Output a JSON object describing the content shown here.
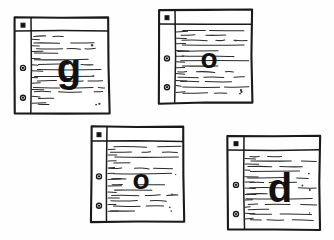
{
  "scene": {
    "title": "Hand-drawn notebook paper letter cards",
    "background_color": "#fefefe",
    "ink_color": "#1a1a1a",
    "word": "good",
    "card_count": 4
  },
  "cards": [
    {
      "id": "card-g",
      "letter": "g",
      "letter_name": "lowercase-g",
      "position": "top-left",
      "x": 15,
      "y": 18,
      "width": 94,
      "height": 96,
      "margin_x": 16,
      "header_y": 13,
      "letter_cx": 54,
      "letter_baseline": 64,
      "letter_size": 40,
      "holes": [
        "square",
        "ring",
        "ring"
      ]
    },
    {
      "id": "card-o-1",
      "letter": "o",
      "letter_name": "lowercase-o",
      "position": "top-right",
      "x": 159,
      "y": 10,
      "width": 93,
      "height": 93,
      "margin_x": 16,
      "header_y": 14,
      "letter_cx": 50,
      "letter_baseline": 58,
      "letter_size": 28,
      "holes": [
        "square",
        "ring",
        "ring"
      ]
    },
    {
      "id": "card-o-2",
      "letter": "o",
      "letter_name": "lowercase-o",
      "position": "bottom-left",
      "x": 91,
      "y": 127,
      "width": 93,
      "height": 95,
      "margin_x": 16,
      "header_y": 14,
      "letter_cx": 50,
      "letter_baseline": 62,
      "letter_size": 28,
      "holes": [
        "square",
        "ring",
        "ring"
      ]
    },
    {
      "id": "card-d",
      "letter": "d",
      "letter_name": "lowercase-d",
      "position": "bottom-right",
      "x": 228,
      "y": 136,
      "width": 92,
      "height": 94,
      "margin_x": 16,
      "header_y": 14,
      "letter_cx": 52,
      "letter_baseline": 66,
      "letter_size": 40,
      "holes": [
        "square",
        "ring",
        "ring"
      ]
    }
  ]
}
